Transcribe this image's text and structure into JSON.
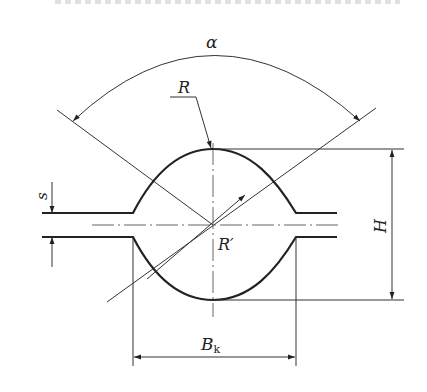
{
  "diagram": {
    "type": "engineering-dimension-drawing",
    "labels": {
      "angle": "α",
      "radius": "R",
      "radius_prime": "R′",
      "thickness": "s",
      "height": "H",
      "width_base": "B",
      "width_sub": "k"
    },
    "colors": {
      "line": "#222222",
      "background": "#ffffff"
    },
    "dimensions": [
      {
        "name": "alpha",
        "kind": "angular",
        "label": "α"
      },
      {
        "name": "R",
        "kind": "radius-leader",
        "label": "R"
      },
      {
        "name": "R-prime",
        "kind": "radius-leader",
        "label": "R′"
      },
      {
        "name": "s",
        "kind": "linear-vertical",
        "label": "s"
      },
      {
        "name": "H",
        "kind": "linear-vertical",
        "label": "H"
      },
      {
        "name": "Bk",
        "kind": "linear-horizontal",
        "label": "Bk"
      }
    ]
  }
}
